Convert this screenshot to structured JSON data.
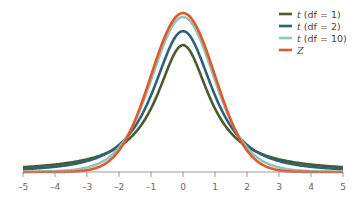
{
  "chart_data": {
    "type": "line",
    "title": "",
    "xlabel": "",
    "ylabel": "",
    "xlim": [
      -5,
      5
    ],
    "x_ticks": [
      -5,
      -4,
      -3,
      -2,
      -1,
      0,
      1,
      2,
      3,
      4,
      5
    ],
    "x_tick_labels": [
      "–5",
      "–4",
      "–3",
      "–2",
      "–1",
      "0",
      "1",
      "2",
      "3",
      "4",
      "5"
    ],
    "grid": false,
    "legend_position": "upper right",
    "series": [
      {
        "name": "t (df = 1)",
        "var": "t",
        "suffix": " (df = 1)",
        "df": 1,
        "color": "#4b5b2f",
        "peak": 0.318
      },
      {
        "name": "t (df = 2)",
        "var": "t",
        "suffix": " (df = 2)",
        "df": 2,
        "color": "#2f6076",
        "peak": 0.354
      },
      {
        "name": "t (df = 10)",
        "var": "t",
        "suffix": " (df = 10)",
        "df": 10,
        "color": "#8cc7bd",
        "peak": 0.389
      },
      {
        "name": "Z",
        "var": "Z",
        "suffix": "",
        "df": null,
        "color": "#e2582b",
        "peak": 0.399
      }
    ]
  }
}
